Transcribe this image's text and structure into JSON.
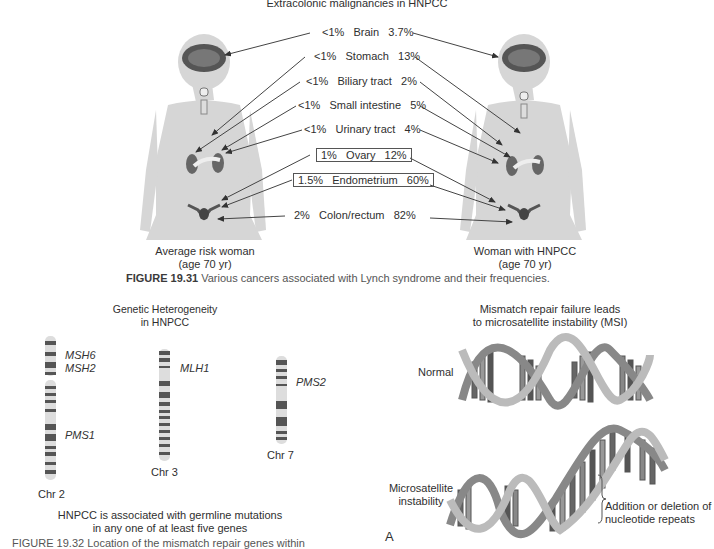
{
  "figure_1931": {
    "title": "Extracolonic malignancies in HNPCC",
    "rows": [
      {
        "avg": "<1%",
        "site": "Brain",
        "hnpcc": "3.7%",
        "boxed": false
      },
      {
        "avg": "<1%",
        "site": "Stomach",
        "hnpcc": "13%",
        "boxed": false
      },
      {
        "avg": "<1%",
        "site": "Biliary tract",
        "hnpcc": "2%",
        "boxed": false
      },
      {
        "avg": "<1%",
        "site": "Small intestine",
        "hnpcc": "5%",
        "boxed": false
      },
      {
        "avg": "<1%",
        "site": "Urinary tract",
        "hnpcc": "4%",
        "boxed": false
      },
      {
        "avg": "1%",
        "site": "Ovary",
        "hnpcc": "12%",
        "boxed": true
      },
      {
        "avg": "1.5%",
        "site": "Endometrium",
        "hnpcc": "60%",
        "boxed": true
      },
      {
        "avg": "2%",
        "site": "Colon/rectum",
        "hnpcc": "82%",
        "boxed": false
      }
    ],
    "left_label": {
      "line1": "Average risk woman",
      "line2": "(age 70 yr)"
    },
    "right_label": {
      "line1": "Woman with HNPCC",
      "line2": "(age 70 yr)"
    },
    "caption_label": "FIGURE 19.31",
    "caption_text": "Various cancers associated with Lynch syndrome and their frequencies."
  },
  "genetic": {
    "title_line1": "Genetic Heterogeneity",
    "title_line2": "in HNPCC",
    "chromosomes": [
      {
        "label": "Chr 2",
        "genes": [
          "MSH6",
          "MSH2",
          "PMS1"
        ]
      },
      {
        "label": "Chr 3",
        "genes": [
          "MLH1"
        ]
      },
      {
        "label": "Chr 7",
        "genes": [
          "PMS2"
        ]
      }
    ],
    "footer_line1": "HNPCC is associated with germline mutations",
    "footer_line2": "in any one of at least five genes"
  },
  "msi": {
    "title_line1": "Mismatch repair failure leads",
    "title_line2": "to microsatellite instability (MSI)",
    "normal_label": "Normal",
    "msi_label_line1": "Microsatellite",
    "msi_label_line2": "instability",
    "annotation_line1": "Addition or deletion of",
    "annotation_line2": "nucleotide repeats",
    "panel_letter": "A"
  },
  "cut_caption": "FIGURE 19.32 Location of the mismatch repair genes within"
}
